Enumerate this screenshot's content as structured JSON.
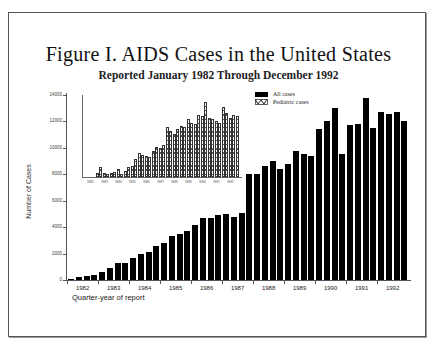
{
  "chart_data": {
    "type": "bar",
    "title": "Figure I. AIDS Cases in the United States",
    "subtitle": "Reported January 1982 Through December 1992",
    "xlabel": "Quarter-year of report",
    "ylabel": "Number of Cases",
    "ylim": [
      0,
      14000
    ],
    "yticks": [
      0,
      2000,
      4000,
      6000,
      8000,
      10000,
      12000,
      14000
    ],
    "year_labels": [
      "1982",
      "1983",
      "1984",
      "1985",
      "1986",
      "1987",
      "1988",
      "1989",
      "1990",
      "1991",
      "1992"
    ],
    "categories": [
      "1982 Q1",
      "1982 Q2",
      "1982 Q3",
      "1982 Q4",
      "1983 Q1",
      "1983 Q2",
      "1983 Q3",
      "1983 Q4",
      "1984 Q1",
      "1984 Q2",
      "1984 Q3",
      "1984 Q4",
      "1985 Q1",
      "1985 Q2",
      "1985 Q3",
      "1985 Q4",
      "1986 Q1",
      "1986 Q2",
      "1986 Q3",
      "1986 Q4",
      "1987 Q1",
      "1987 Q2",
      "1987 Q3",
      "1987 Q4",
      "1988 Q1",
      "1988 Q2",
      "1988 Q3",
      "1988 Q4",
      "1989 Q1",
      "1989 Q2",
      "1989 Q3",
      "1989 Q4",
      "1990 Q1",
      "1990 Q2",
      "1990 Q3",
      "1990 Q4",
      "1991 Q1",
      "1991 Q2",
      "1991 Q3",
      "1991 Q4",
      "1992 Q1",
      "1992 Q2",
      "1992 Q3",
      "1992 Q4"
    ],
    "series": [
      {
        "name": "All cases",
        "color": "#000000",
        "values": [
          100,
          200,
          300,
          400,
          600,
          900,
          1300,
          1300,
          1700,
          2000,
          2100,
          2600,
          2800,
          3300,
          3500,
          3700,
          4200,
          4700,
          4700,
          4900,
          5000,
          4800,
          5100,
          8000,
          8000,
          8600,
          9000,
          8400,
          8800,
          9800,
          9500,
          9400,
          11400,
          12000,
          13000,
          9500,
          11700,
          11800,
          13800,
          11500,
          12700,
          12600,
          12700,
          12000
        ]
      }
    ],
    "legend": {
      "position": "top-right of inset",
      "entries": [
        "All cases",
        "Pediatric cases"
      ]
    },
    "inset": {
      "description": "Pediatric cases by quarter-year (small inset chart, hatched bars)",
      "year_labels": [
        "1982",
        "1983",
        "1984",
        "1985",
        "1986",
        "1987",
        "1988",
        "1989",
        "1990",
        "1991",
        "1992"
      ],
      "series": [
        {
          "name": "Pediatric cases",
          "relative_heights": [
            0,
            0,
            0,
            0.05,
            0.12,
            0.05,
            0.04,
            0.05,
            0.06,
            0.1,
            0.04,
            0.08,
            0.12,
            0.14,
            0.22,
            0.3,
            0.28,
            0.26,
            0.25,
            0.32,
            0.38,
            0.36,
            0.4,
            0.62,
            0.58,
            0.54,
            0.6,
            0.64,
            0.62,
            0.72,
            0.68,
            0.66,
            0.78,
            0.76,
            0.94,
            0.74,
            0.72,
            0.7,
            0.68,
            0.88,
            0.8,
            0.74,
            0.78,
            0.76
          ]
        }
      ]
    },
    "grid": false
  },
  "labels": {
    "title": "Figure I. AIDS Cases in the United States",
    "subtitle": "Reported January 1982 Through December 1992",
    "ylabel": "Number of Cases",
    "xlabel": "Quarter-year of report",
    "legend_all": "All cases",
    "legend_ped": "Pediatric cases"
  }
}
